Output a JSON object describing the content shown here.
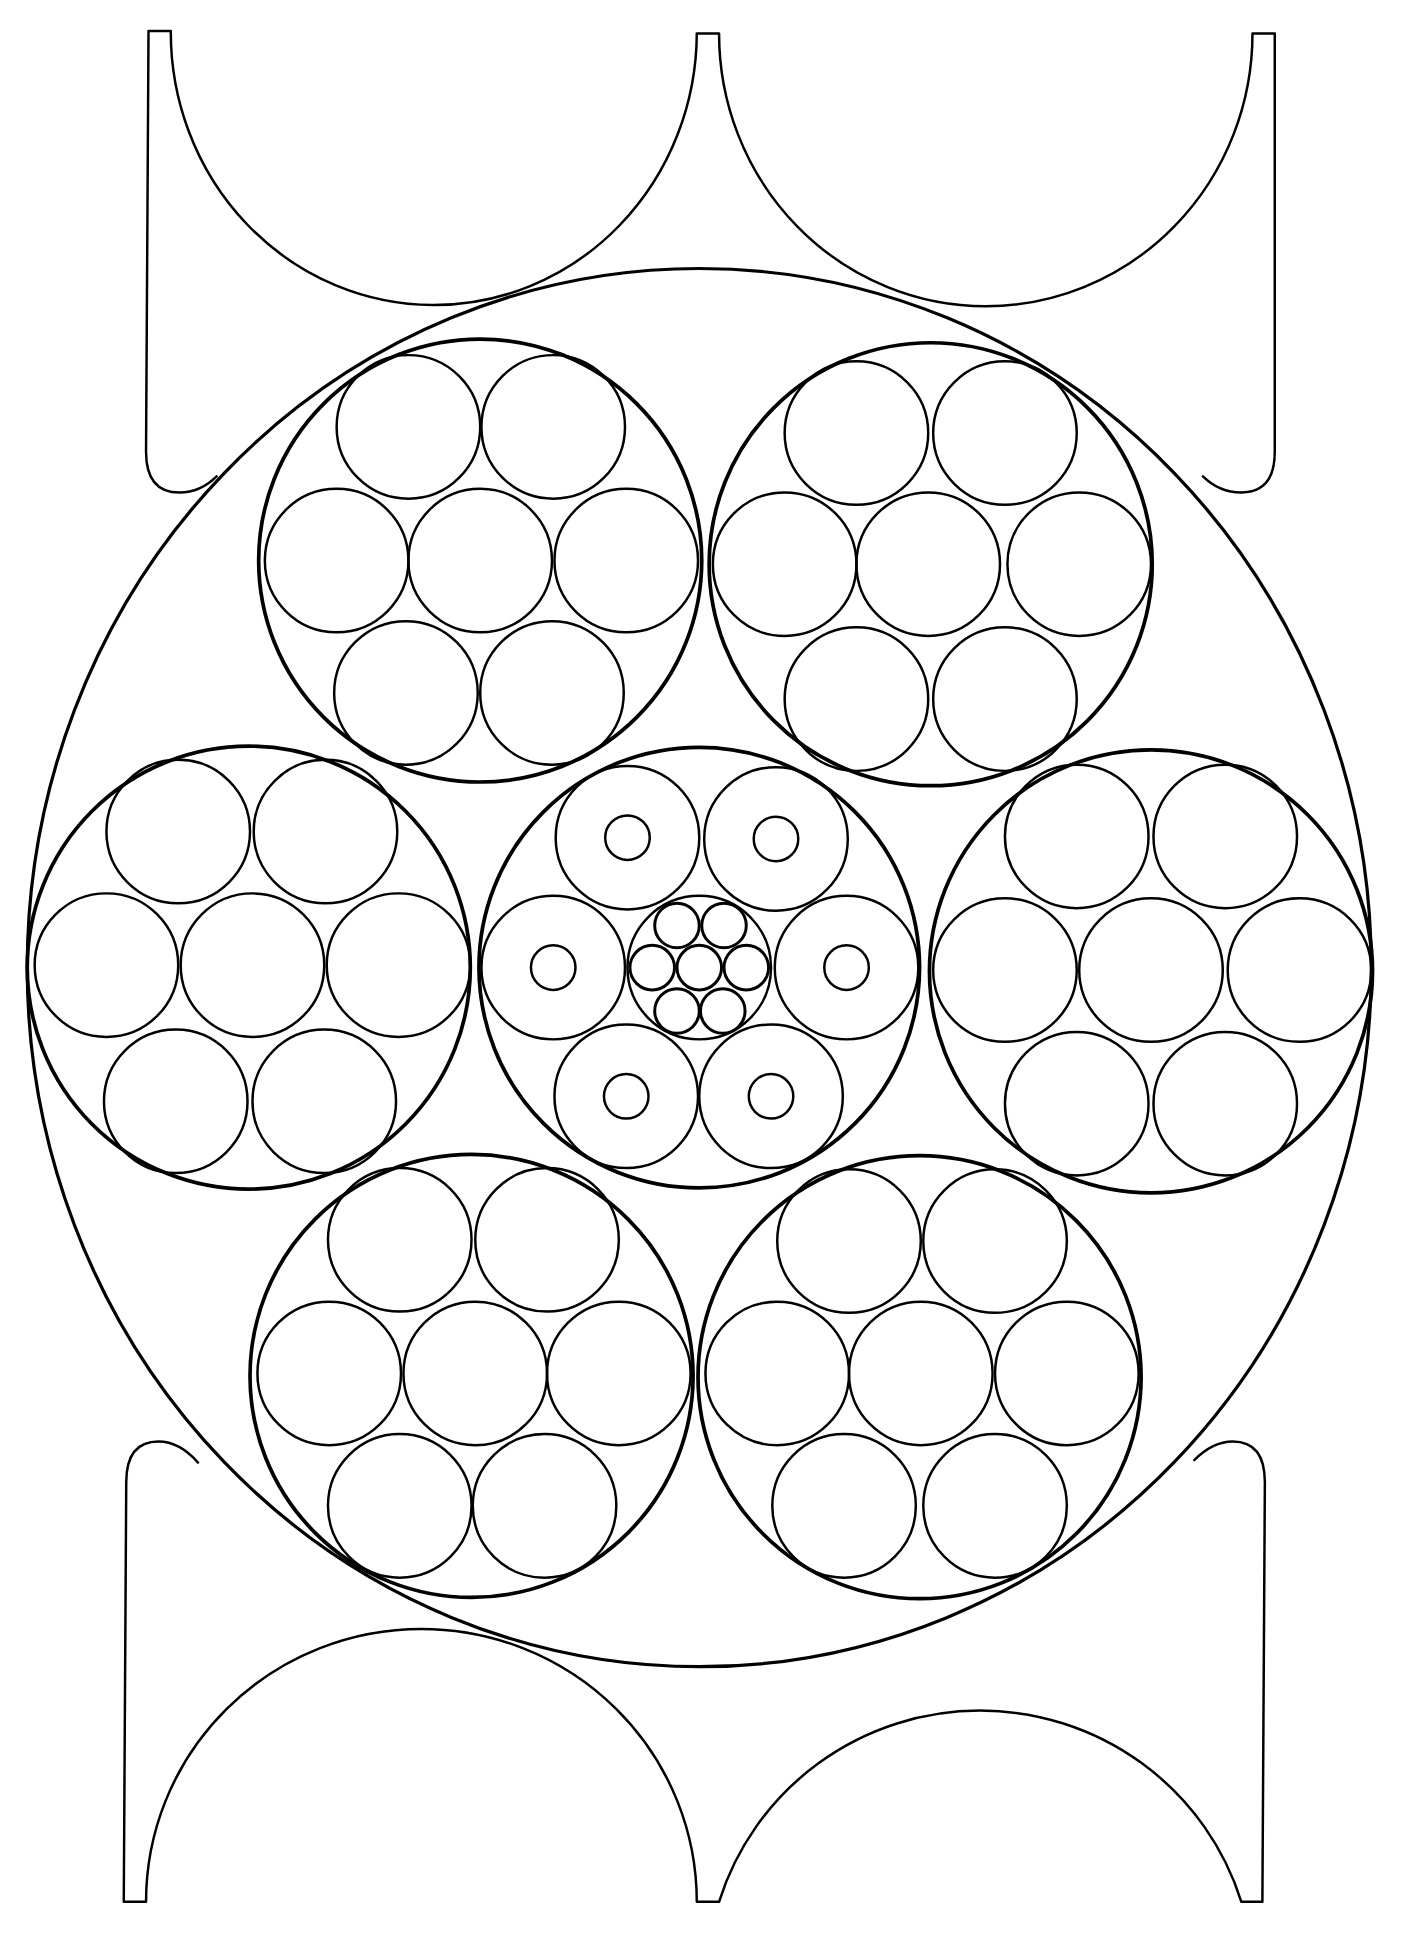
{
  "canvas": {
    "viewbox_w": 1132,
    "viewbox_h": 1563,
    "background": "#ffffff",
    "ink": "#000000"
  },
  "outer_circle": {
    "cx": 565,
    "cy": 782,
    "rx": 543,
    "ry": 565,
    "stroke": 2.6
  },
  "top_frame": {
    "path": "M 120 25 L 138 25 A 212 220 0 0 0 563 27 L 581 27 A 215 220 0 0 0 1012 27 L 1030 27 L 1030 365 Q 1030 398 1003 398 Q 985 398 972 385 M 120 25 L 118 365 Q 118 398 145 398 Q 162 398 175 385"
  },
  "bottom_frame": {
    "path": "M 100 1537 L 118 1537 A 222 220 0 0 1 563 1537 L 581 1537 A 221 220 0 0 1 1003 1537 L 1020 1537 L 1022 1198 Q 1022 1165 996 1165 Q 980 1165 965 1180 M 100 1537 L 102 1198 Q 102 1165 128 1165 Q 145 1165 160 1182"
  },
  "medium_circles": [
    {
      "name": "top-left",
      "cx": 388,
      "cy": 453,
      "r": 179,
      "small_r": 58,
      "smalls": [
        [
          330,
          345
        ],
        [
          447,
          345
        ],
        [
          272,
          453
        ],
        [
          388,
          453
        ],
        [
          506,
          453
        ],
        [
          328,
          560
        ],
        [
          446,
          560
        ]
      ]
    },
    {
      "name": "top-right",
      "cx": 752,
      "cy": 456,
      "r": 179,
      "small_r": 58,
      "smalls": [
        [
          692,
          350
        ],
        [
          812,
          350
        ],
        [
          634,
          456
        ],
        [
          750,
          456
        ],
        [
          872,
          456
        ],
        [
          692,
          565
        ],
        [
          812,
          565
        ]
      ]
    },
    {
      "name": "middle-left",
      "cx": 201,
      "cy": 782,
      "r": 179,
      "small_r": 58,
      "smalls": [
        [
          144,
          672
        ],
        [
          263,
          672
        ],
        [
          86,
          780
        ],
        [
          204,
          780
        ],
        [
          322,
          780
        ],
        [
          142,
          890
        ],
        [
          262,
          890
        ]
      ]
    },
    {
      "name": "middle-right",
      "cx": 930,
      "cy": 785,
      "r": 179,
      "small_r": 58,
      "smalls": [
        [
          870,
          676
        ],
        [
          990,
          676
        ],
        [
          812,
          784
        ],
        [
          930,
          784
        ],
        [
          1050,
          784
        ],
        [
          870,
          892
        ],
        [
          990,
          892
        ]
      ]
    },
    {
      "name": "bottom-left",
      "cx": 381,
      "cy": 1112,
      "r": 179,
      "small_r": 58,
      "smalls": [
        [
          323,
          1002
        ],
        [
          442,
          1002
        ],
        [
          266,
          1110
        ],
        [
          384,
          1110
        ],
        [
          500,
          1110
        ],
        [
          323,
          1217
        ],
        [
          440,
          1217
        ]
      ]
    },
    {
      "name": "bottom-right",
      "cx": 743,
      "cy": 1113,
      "r": 179,
      "small_r": 58,
      "smalls": [
        [
          686,
          1003
        ],
        [
          804,
          1003
        ],
        [
          628,
          1110
        ],
        [
          744,
          1110
        ],
        [
          862,
          1110
        ],
        [
          682,
          1217
        ],
        [
          804,
          1217
        ]
      ]
    }
  ],
  "center_circle": {
    "cx": 565,
    "cy": 782,
    "r": 178,
    "rings": [
      {
        "cx": 507,
        "cy": 677,
        "r": 58,
        "inner_r": 18
      },
      {
        "cx": 627,
        "cy": 678,
        "r": 58,
        "inner_r": 18
      },
      {
        "cx": 447,
        "cy": 782,
        "r": 58,
        "inner_r": 18
      },
      {
        "cx": 684,
        "cy": 782,
        "r": 58,
        "inner_r": 18
      },
      {
        "cx": 506,
        "cy": 886,
        "r": 58,
        "inner_r": 18
      },
      {
        "cx": 623,
        "cy": 886,
        "r": 58,
        "inner_r": 18
      }
    ],
    "hub": {
      "cx": 565,
      "cy": 782,
      "r": 58,
      "tiny_r": 18,
      "tinies": [
        [
          547,
          748
        ],
        [
          585,
          748
        ],
        [
          527,
          782
        ],
        [
          565,
          782
        ],
        [
          603,
          782
        ],
        [
          547,
          817
        ],
        [
          584,
          817
        ]
      ]
    }
  }
}
